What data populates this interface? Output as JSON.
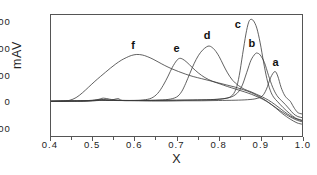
{
  "chart_data": {
    "type": "line",
    "title": "",
    "subtitle": "",
    "xlabel": "X",
    "ylabel": "mAV",
    "xlim": [
      0.4,
      1.0
    ],
    "ylim": [
      -130,
      330
    ],
    "grid": false,
    "legend": "inline-labels",
    "xticks": [
      "0.4",
      "0.5",
      "0.6",
      "0.7",
      "0.8",
      "0.9",
      "1.0"
    ],
    "xtick_values": [
      0.4,
      0.5,
      0.6,
      0.7,
      0.8,
      0.9,
      1.0
    ],
    "yticks": [
      "300",
      "200",
      "100",
      "0",
      "-100"
    ],
    "ytick_values": [
      300,
      200,
      100,
      0,
      -100
    ],
    "annotations": [
      {
        "text": "a",
        "x": 0.935,
        "y": 145
      },
      {
        "text": "b",
        "x": 0.878,
        "y": 218
      },
      {
        "text": "c",
        "x": 0.845,
        "y": 288
      },
      {
        "text": "d",
        "x": 0.772,
        "y": 248
      },
      {
        "text": "e",
        "x": 0.7,
        "y": 200
      },
      {
        "text": "f",
        "x": 0.6,
        "y": 212
      }
    ],
    "series": [
      {
        "name": "a",
        "peak_x": 0.935,
        "peak_y": 115,
        "color": "#3a3a3a",
        "points": [
          [
            0.4,
            2
          ],
          [
            0.44,
            3
          ],
          [
            0.47,
            2
          ],
          [
            0.5,
            4
          ],
          [
            0.52,
            6
          ],
          [
            0.54,
            5
          ],
          [
            0.56,
            12
          ],
          [
            0.57,
            5
          ],
          [
            0.6,
            4
          ],
          [
            0.64,
            3
          ],
          [
            0.68,
            3
          ],
          [
            0.72,
            4
          ],
          [
            0.76,
            4
          ],
          [
            0.8,
            5
          ],
          [
            0.84,
            6
          ],
          [
            0.87,
            8
          ],
          [
            0.89,
            12
          ],
          [
            0.905,
            22
          ],
          [
            0.915,
            48
          ],
          [
            0.925,
            92
          ],
          [
            0.935,
            115
          ],
          [
            0.942,
            98
          ],
          [
            0.95,
            55
          ],
          [
            0.958,
            26
          ],
          [
            0.965,
            12
          ],
          [
            0.972,
            2
          ],
          [
            0.98,
            -20
          ],
          [
            0.988,
            -38
          ],
          [
            0.994,
            -44
          ],
          [
            1.0,
            -46
          ]
        ]
      },
      {
        "name": "b",
        "peak_x": 0.893,
        "peak_y": 185,
        "color": "#3a3a3a",
        "points": [
          [
            0.4,
            2
          ],
          [
            0.44,
            3
          ],
          [
            0.48,
            4
          ],
          [
            0.51,
            8
          ],
          [
            0.525,
            14
          ],
          [
            0.54,
            10
          ],
          [
            0.56,
            6
          ],
          [
            0.6,
            5
          ],
          [
            0.65,
            5
          ],
          [
            0.7,
            6
          ],
          [
            0.75,
            7
          ],
          [
            0.79,
            9
          ],
          [
            0.82,
            14
          ],
          [
            0.84,
            26
          ],
          [
            0.855,
            55
          ],
          [
            0.868,
            112
          ],
          [
            0.878,
            158
          ],
          [
            0.888,
            182
          ],
          [
            0.893,
            185
          ],
          [
            0.9,
            178
          ],
          [
            0.91,
            150
          ],
          [
            0.92,
            100
          ],
          [
            0.93,
            55
          ],
          [
            0.94,
            24
          ],
          [
            0.95,
            6
          ],
          [
            0.96,
            -10
          ],
          [
            0.97,
            -28
          ],
          [
            0.98,
            -46
          ],
          [
            0.99,
            -56
          ],
          [
            1.0,
            -60
          ]
        ]
      },
      {
        "name": "c",
        "peak_x": 0.877,
        "peak_y": 313,
        "color": "#3a3a3a",
        "points": [
          [
            0.4,
            2
          ],
          [
            0.45,
            3
          ],
          [
            0.5,
            5
          ],
          [
            0.52,
            9
          ],
          [
            0.545,
            6
          ],
          [
            0.58,
            5
          ],
          [
            0.62,
            5
          ],
          [
            0.66,
            6
          ],
          [
            0.7,
            6
          ],
          [
            0.74,
            7
          ],
          [
            0.78,
            8
          ],
          [
            0.81,
            11
          ],
          [
            0.83,
            20
          ],
          [
            0.842,
            48
          ],
          [
            0.85,
            100
          ],
          [
            0.858,
            180
          ],
          [
            0.866,
            258
          ],
          [
            0.872,
            300
          ],
          [
            0.877,
            313
          ],
          [
            0.884,
            308
          ],
          [
            0.892,
            280
          ],
          [
            0.9,
            224
          ],
          [
            0.908,
            152
          ],
          [
            0.916,
            88
          ],
          [
            0.924,
            44
          ],
          [
            0.932,
            18
          ],
          [
            0.942,
            0
          ],
          [
            0.955,
            -22
          ],
          [
            0.97,
            -44
          ],
          [
            0.985,
            -62
          ],
          [
            1.0,
            -70
          ]
        ]
      },
      {
        "name": "d",
        "peak_x": 0.778,
        "peak_y": 212,
        "color": "#3a3a3a",
        "points": [
          [
            0.4,
            2
          ],
          [
            0.45,
            3
          ],
          [
            0.5,
            4
          ],
          [
            0.53,
            6
          ],
          [
            0.57,
            5
          ],
          [
            0.61,
            5
          ],
          [
            0.65,
            6
          ],
          [
            0.68,
            9
          ],
          [
            0.7,
            18
          ],
          [
            0.712,
            38
          ],
          [
            0.722,
            70
          ],
          [
            0.732,
            108
          ],
          [
            0.742,
            145
          ],
          [
            0.752,
            175
          ],
          [
            0.762,
            196
          ],
          [
            0.772,
            209
          ],
          [
            0.778,
            212
          ],
          [
            0.784,
            208
          ],
          [
            0.792,
            196
          ],
          [
            0.802,
            172
          ],
          [
            0.812,
            140
          ],
          [
            0.822,
            110
          ],
          [
            0.834,
            82
          ],
          [
            0.848,
            62
          ],
          [
            0.862,
            48
          ],
          [
            0.878,
            38
          ],
          [
            0.892,
            28
          ],
          [
            0.906,
            18
          ],
          [
            0.92,
            6
          ],
          [
            0.935,
            -10
          ],
          [
            0.95,
            -28
          ],
          [
            0.965,
            -46
          ],
          [
            0.982,
            -62
          ],
          [
            1.0,
            -72
          ]
        ]
      },
      {
        "name": "e",
        "peak_x": 0.707,
        "peak_y": 165,
        "color": "#3a3a3a",
        "points": [
          [
            0.4,
            2
          ],
          [
            0.45,
            3
          ],
          [
            0.49,
            4
          ],
          [
            0.52,
            7
          ],
          [
            0.55,
            5
          ],
          [
            0.59,
            5
          ],
          [
            0.62,
            7
          ],
          [
            0.64,
            14
          ],
          [
            0.655,
            32
          ],
          [
            0.668,
            62
          ],
          [
            0.68,
            98
          ],
          [
            0.69,
            131
          ],
          [
            0.7,
            156
          ],
          [
            0.707,
            165
          ],
          [
            0.715,
            162
          ],
          [
            0.725,
            150
          ],
          [
            0.738,
            130
          ],
          [
            0.752,
            110
          ],
          [
            0.768,
            92
          ],
          [
            0.786,
            78
          ],
          [
            0.804,
            68
          ],
          [
            0.822,
            58
          ],
          [
            0.842,
            48
          ],
          [
            0.862,
            38
          ],
          [
            0.88,
            28
          ],
          [
            0.898,
            16
          ],
          [
            0.915,
            2
          ],
          [
            0.932,
            -16
          ],
          [
            0.95,
            -36
          ],
          [
            0.968,
            -54
          ],
          [
            0.985,
            -68
          ],
          [
            1.0,
            -76
          ]
        ]
      },
      {
        "name": "f",
        "peak_x": 0.605,
        "peak_y": 180,
        "color": "#3a3a3a",
        "points": [
          [
            0.4,
            2
          ],
          [
            0.43,
            3
          ],
          [
            0.445,
            6
          ],
          [
            0.46,
            16
          ],
          [
            0.475,
            34
          ],
          [
            0.49,
            56
          ],
          [
            0.505,
            78
          ],
          [
            0.518,
            96
          ],
          [
            0.53,
            112
          ],
          [
            0.542,
            128
          ],
          [
            0.555,
            144
          ],
          [
            0.568,
            158
          ],
          [
            0.58,
            168
          ],
          [
            0.592,
            176
          ],
          [
            0.605,
            180
          ],
          [
            0.618,
            178
          ],
          [
            0.63,
            172
          ],
          [
            0.644,
            162
          ],
          [
            0.658,
            150
          ],
          [
            0.672,
            138
          ],
          [
            0.688,
            126
          ],
          [
            0.705,
            115
          ],
          [
            0.722,
            105
          ],
          [
            0.74,
            96
          ],
          [
            0.76,
            88
          ],
          [
            0.78,
            80
          ],
          [
            0.8,
            72
          ],
          [
            0.82,
            64
          ],
          [
            0.84,
            56
          ],
          [
            0.86,
            46
          ],
          [
            0.88,
            34
          ],
          [
            0.9,
            18
          ],
          [
            0.918,
            0
          ],
          [
            0.936,
            -22
          ],
          [
            0.954,
            -46
          ],
          [
            0.972,
            -66
          ],
          [
            0.988,
            -80
          ],
          [
            1.0,
            -85
          ]
        ]
      }
    ]
  }
}
